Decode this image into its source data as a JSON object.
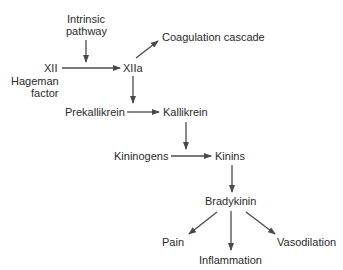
{
  "diagram": {
    "colors": {
      "text": "#2a2a2a",
      "arrow": "#4a4a4a",
      "background": "#ffffff"
    },
    "nodes": {
      "intrinsic_line1": "Intrinsic",
      "intrinsic_line2": "pathway",
      "xii": "XII",
      "hageman_line1": "Hageman",
      "hageman_line2": "factor",
      "xiia": "XIIa",
      "coagulation": "Coagulation cascade",
      "prekallikrein": "Prekallikrein",
      "kallikrein": "Kallikrein",
      "kininogens": "Kininogens",
      "kinins": "Kinins",
      "bradykinin": "Bradykinin",
      "pain": "Pain",
      "inflammation": "Inflammation",
      "vasodilation": "Vasodilation"
    },
    "edges": [
      {
        "from": "Intrinsic pathway",
        "to": "XII→XIIa arrow"
      },
      {
        "from": "XII",
        "to": "XIIa"
      },
      {
        "from": "XIIa",
        "to": "Coagulation cascade"
      },
      {
        "from": "XIIa",
        "to": "Prekallikrein→Kallikrein arrow"
      },
      {
        "from": "Prekallikrein",
        "to": "Kallikrein"
      },
      {
        "from": "Kallikrein",
        "to": "Kininogens→Kinins arrow"
      },
      {
        "from": "Kininogens",
        "to": "Kinins"
      },
      {
        "from": "Kinins",
        "to": "Bradykinin"
      },
      {
        "from": "Bradykinin",
        "to": "Pain"
      },
      {
        "from": "Bradykinin",
        "to": "Inflammation"
      },
      {
        "from": "Bradykinin",
        "to": "Vasodilation"
      }
    ]
  }
}
